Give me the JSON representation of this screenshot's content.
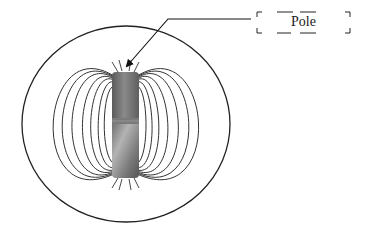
{
  "diagram": {
    "type": "bar-magnet-field-lines",
    "label": {
      "text": "Pole",
      "box_style": "dashed-corners"
    },
    "magnet": {
      "orientation": "vertical",
      "segments": 2,
      "fill_dark": "#6e6e6e",
      "fill_light": "#a8a8a8"
    },
    "field_lines": {
      "left_loops": 7,
      "right_loops": 7,
      "stroke": "#333333"
    },
    "boundary": {
      "shape": "ellipse",
      "stroke": "#222222"
    },
    "pointer": {
      "from": "label",
      "to": "magnet-top-pole",
      "arrowhead": true
    }
  }
}
